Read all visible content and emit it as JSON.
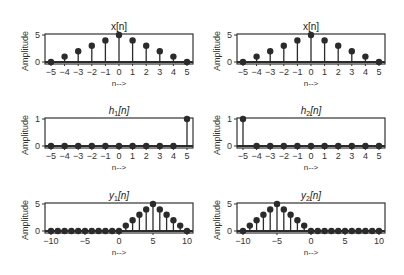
{
  "chart_data": [
    {
      "type": "stem",
      "title": "x[n]",
      "xlabel": "n-->",
      "ylabel": "Amplitude",
      "x": [
        -5,
        -4,
        -3,
        -2,
        -1,
        0,
        1,
        2,
        3,
        4,
        5
      ],
      "values": [
        0,
        1,
        2,
        3,
        4,
        5,
        4,
        3,
        2,
        1,
        0
      ],
      "xticks": [
        -5,
        -4,
        -3,
        -2,
        -1,
        0,
        1,
        2,
        3,
        4,
        5
      ],
      "xtick_labels": [
        "−5",
        "−4",
        "−3",
        "−2",
        "−1",
        "0",
        "1",
        "2",
        "3",
        "4",
        "5"
      ],
      "yticks": [
        0,
        5
      ],
      "xlim": [
        -5,
        5
      ],
      "ylim": [
        0,
        5
      ],
      "grid": false
    },
    {
      "type": "stem",
      "title": "x[n]",
      "xlabel": "n-->",
      "ylabel": "Amplitude",
      "x": [
        -5,
        -4,
        -3,
        -2,
        -1,
        0,
        1,
        2,
        3,
        4,
        5
      ],
      "values": [
        0,
        1,
        2,
        3,
        4,
        5,
        4,
        3,
        2,
        1,
        0
      ],
      "xticks": [
        -5,
        -4,
        -3,
        -2,
        -1,
        0,
        1,
        2,
        3,
        4,
        5
      ],
      "xtick_labels": [
        "−5",
        "−4",
        "−3",
        "−2",
        "−1",
        "0",
        "1",
        "2",
        "3",
        "4",
        "5"
      ],
      "yticks": [
        0,
        5
      ],
      "xlim": [
        -5,
        5
      ],
      "ylim": [
        0,
        5
      ],
      "grid": false
    },
    {
      "type": "stem",
      "title": "h1[n]",
      "xlabel": "n-->",
      "ylabel": "Amplitude",
      "x": [
        -5,
        -4,
        -3,
        -2,
        -1,
        0,
        1,
        2,
        3,
        4,
        5
      ],
      "values": [
        0,
        0,
        0,
        0,
        0,
        0,
        0,
        0,
        0,
        0,
        1
      ],
      "xticks": [
        -5,
        -4,
        -3,
        -2,
        -1,
        0,
        1,
        2,
        3,
        4,
        5
      ],
      "xtick_labels": [
        "−5",
        "−4",
        "−3",
        "−2",
        "−1",
        "0",
        "1",
        "2",
        "3",
        "4",
        "5"
      ],
      "yticks": [
        0,
        1
      ],
      "xlim": [
        -5,
        5
      ],
      "ylim": [
        0,
        1
      ],
      "grid": false
    },
    {
      "type": "stem",
      "title": "h2[n]",
      "xlabel": "n-->",
      "ylabel": "Amplitude",
      "x": [
        -5,
        -4,
        -3,
        -2,
        -1,
        0,
        1,
        2,
        3,
        4,
        5
      ],
      "values": [
        1,
        0,
        0,
        0,
        0,
        0,
        0,
        0,
        0,
        0,
        0
      ],
      "xticks": [
        -5,
        -4,
        -3,
        -2,
        -1,
        0,
        1,
        2,
        3,
        4,
        5
      ],
      "xtick_labels": [
        "−5",
        "−4",
        "−3",
        "−2",
        "−1",
        "0",
        "1",
        "2",
        "3",
        "4",
        "5"
      ],
      "yticks": [
        0,
        1
      ],
      "xlim": [
        -5,
        5
      ],
      "ylim": [
        0,
        1
      ],
      "grid": false
    },
    {
      "type": "stem",
      "title": "y1[n]",
      "xlabel": "n-->",
      "ylabel": "Amplitude",
      "x": [
        -10,
        -9,
        -8,
        -7,
        -6,
        -5,
        -4,
        -3,
        -2,
        -1,
        0,
        1,
        2,
        3,
        4,
        5,
        6,
        7,
        8,
        9,
        10
      ],
      "values": [
        0,
        0,
        0,
        0,
        0,
        0,
        0,
        0,
        0,
        0,
        0,
        1,
        2,
        3,
        4,
        5,
        4,
        3,
        2,
        1,
        0
      ],
      "xticks": [
        -10,
        -5,
        0,
        5,
        10
      ],
      "xtick_labels": [
        "−10",
        "−5",
        "0",
        "5",
        "10"
      ],
      "yticks": [
        0,
        5
      ],
      "xlim": [
        -10,
        10
      ],
      "ylim": [
        0,
        5
      ],
      "grid": false
    },
    {
      "type": "stem",
      "title": "y2[n]",
      "xlabel": "n-->",
      "ylabel": "Amplitude",
      "x": [
        -10,
        -9,
        -8,
        -7,
        -6,
        -5,
        -4,
        -3,
        -2,
        -1,
        0,
        1,
        2,
        3,
        4,
        5,
        6,
        7,
        8,
        9,
        10
      ],
      "values": [
        0,
        1,
        2,
        3,
        4,
        5,
        4,
        3,
        2,
        1,
        0,
        0,
        0,
        0,
        0,
        0,
        0,
        0,
        0,
        0,
        0
      ],
      "xticks": [
        -10,
        -5,
        0,
        5,
        10
      ],
      "xtick_labels": [
        "−10",
        "−5",
        "0",
        "5",
        "10"
      ],
      "yticks": [
        0,
        5
      ],
      "xlim": [
        -10,
        10
      ],
      "ylim": [
        0,
        5
      ],
      "grid": false
    }
  ],
  "panels": [
    {
      "title_main": "x",
      "title_sub": "",
      "title_tail": "[n]",
      "italic": false
    },
    {
      "title_main": "x",
      "title_sub": "",
      "title_tail": "[n]",
      "italic": false
    },
    {
      "title_main": "h",
      "title_sub": "1",
      "title_tail": "[n]",
      "italic": true
    },
    {
      "title_main": "h",
      "title_sub": "2",
      "title_tail": "[n]",
      "italic": true
    },
    {
      "title_main": "y",
      "title_sub": "1",
      "title_tail": "[n]",
      "italic": true
    },
    {
      "title_main": "y",
      "title_sub": "2",
      "title_tail": "[n]",
      "italic": true
    }
  ],
  "colors": {
    "stem": "#2b2b2b",
    "axes": "#333333",
    "background": "#ffffff"
  }
}
